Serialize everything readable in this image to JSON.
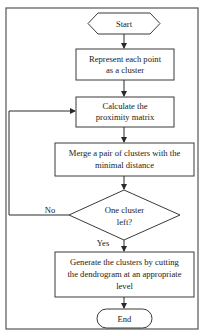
{
  "flowchart": {
    "nodes": {
      "start": {
        "type": "terminator-hexagon",
        "label": "Start"
      },
      "represent": {
        "type": "process",
        "line1": "Represent each point",
        "line2": "as a cluster"
      },
      "proximity": {
        "type": "process",
        "line1": "Calculate the",
        "line2": "proximity matrix"
      },
      "merge": {
        "type": "process",
        "line1": "Merge a pair of clusters with the",
        "line2": "minimal distance"
      },
      "decision": {
        "type": "decision",
        "line1": "One cluster",
        "line2": "left?"
      },
      "generate": {
        "type": "process",
        "line1": "Generate the clusters by cutting",
        "line2": "the dendrogram at an appropriate",
        "line3": "level"
      },
      "end": {
        "type": "terminator-rounded",
        "label": "End"
      }
    },
    "edges": {
      "no_label": "No",
      "yes_label": "Yes"
    },
    "flow": [
      "Start -> Represent each point as a cluster",
      "Represent each point as a cluster -> Calculate the proximity matrix",
      "Calculate the proximity matrix -> Merge a pair of clusters with the minimal distance",
      "Merge a pair of clusters with the minimal distance -> One cluster left?",
      "One cluster left? (No) -> Calculate the proximity matrix",
      "One cluster left? (Yes) -> Generate the clusters by cutting the dendrogram at an appropriate level",
      "Generate the clusters ... -> End"
    ],
    "colors": {
      "stroke": "#3a3a3a",
      "fill": "#ffffff",
      "text": "#1a1a1a"
    }
  }
}
